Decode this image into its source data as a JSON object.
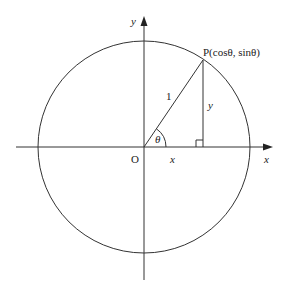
{
  "diagram": {
    "title": "",
    "labels": {
      "y_axis": "y",
      "x_axis": "x",
      "origin": "O",
      "point_p": "P(cosθ, sinθ)",
      "hypotenuse": "1",
      "opposite": "y",
      "adjacent": "x",
      "angle": "θ"
    },
    "geometry": {
      "center": [
        144,
        147
      ],
      "radius": 106,
      "point_p": [
        203,
        60
      ],
      "foot": [
        203,
        147
      ]
    },
    "colors": {
      "stroke": "#333333",
      "text": "#222222",
      "background": "#ffffff"
    }
  }
}
